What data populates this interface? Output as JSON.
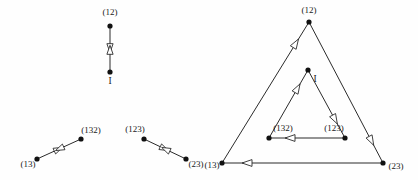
{
  "figure": {
    "background_color": "#fefefe",
    "edge_color": "#2b2b2b",
    "vertex_color": "#111111",
    "arrow_fill": "#ffffff",
    "width": 418,
    "height": 180
  },
  "panels": [
    {
      "id": "left-panel",
      "name": "left-diagram",
      "description": "Three disconnected bidirectional edges",
      "nodes": [
        {
          "id": "l-12",
          "label": "(12)",
          "x": 110,
          "y": 26,
          "label_x": 110,
          "label_y": 15,
          "label_anchor": "middle"
        },
        {
          "id": "l-I",
          "label": "I",
          "x": 110,
          "y": 72,
          "label_x": 110,
          "label_y": 84,
          "label_anchor": "middle"
        },
        {
          "id": "l-13",
          "label": "(13)",
          "x": 37,
          "y": 159,
          "label_x": 28,
          "label_y": 167,
          "label_anchor": "middle"
        },
        {
          "id": "l-132",
          "label": "(132)",
          "x": 81,
          "y": 139,
          "label_x": 91,
          "label_y": 133,
          "label_anchor": "middle"
        },
        {
          "id": "l-123",
          "label": "(123)",
          "x": 144,
          "y": 139,
          "label_x": 135,
          "label_y": 132,
          "label_anchor": "middle"
        },
        {
          "id": "l-23",
          "label": "(23)",
          "x": 186,
          "y": 159,
          "label_x": 196,
          "label_y": 167,
          "label_anchor": "middle"
        }
      ],
      "edges": [
        {
          "id": "l-e1",
          "from": "l-12",
          "to": "l-I",
          "type": "bidirectional"
        },
        {
          "id": "l-e2",
          "from": "l-13",
          "to": "l-132",
          "type": "bidirectional"
        },
        {
          "id": "l-e3",
          "from": "l-123",
          "to": "l-23",
          "type": "bidirectional"
        }
      ]
    },
    {
      "id": "right-panel",
      "name": "right-diagram",
      "description": "Outer triangle and inner triangle with directed edges",
      "nodes": [
        {
          "id": "r-12",
          "label": "(12)",
          "x": 309,
          "y": 22,
          "label_x": 309,
          "label_y": 13,
          "label_anchor": "middle"
        },
        {
          "id": "r-13",
          "label": "(13)",
          "x": 222,
          "y": 163,
          "label_x": 212,
          "label_y": 168,
          "label_anchor": "middle"
        },
        {
          "id": "r-23",
          "label": "(23)",
          "x": 383,
          "y": 163,
          "label_x": 396,
          "label_y": 169,
          "label_anchor": "middle"
        },
        {
          "id": "r-I",
          "label": "I",
          "x": 308,
          "y": 70,
          "label_x": 315,
          "label_y": 82,
          "label_anchor": "middle"
        },
        {
          "id": "r-132",
          "label": "(132)",
          "x": 269,
          "y": 138,
          "label_x": 283,
          "label_y": 131,
          "label_anchor": "middle"
        },
        {
          "id": "r-123",
          "label": "(123)",
          "x": 345,
          "y": 138,
          "label_x": 334,
          "label_y": 131,
          "label_anchor": "middle"
        }
      ],
      "edges": [
        {
          "id": "r-e1",
          "from": "r-13",
          "to": "r-12",
          "type": "directed",
          "loop": "outer"
        },
        {
          "id": "r-e2",
          "from": "r-23",
          "to": "r-13",
          "type": "directed",
          "loop": "outer"
        },
        {
          "id": "r-e3",
          "from": "r-12",
          "to": "r-23",
          "type": "directed",
          "loop": "outer"
        },
        {
          "id": "r-e4",
          "from": "r-132",
          "to": "r-I",
          "type": "directed",
          "loop": "inner"
        },
        {
          "id": "r-e5",
          "from": "r-I",
          "to": "r-123",
          "type": "directed",
          "loop": "inner"
        },
        {
          "id": "r-e6",
          "from": "r-123",
          "to": "r-132",
          "type": "directed",
          "loop": "inner"
        }
      ]
    }
  ]
}
